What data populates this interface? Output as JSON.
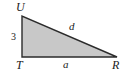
{
  "figure": {
    "name": "right-triangle-TUR",
    "shape": "right triangle",
    "fill_color": "#c8c8c8",
    "stroke_color": "#2b2b2b",
    "background_color": "#ffffff",
    "vertices": [
      {
        "label": "U",
        "x": 22,
        "y": 16
      },
      {
        "label": "T",
        "x": 22,
        "y": 57
      },
      {
        "label": "R",
        "x": 117,
        "y": 57
      }
    ],
    "labels": {
      "vertex_top_left": "U",
      "vertex_bottom_left": "T",
      "vertex_bottom_right": "R",
      "side_hypotenuse": "d",
      "side_bottom": "a",
      "side_left_measure": "3"
    }
  }
}
